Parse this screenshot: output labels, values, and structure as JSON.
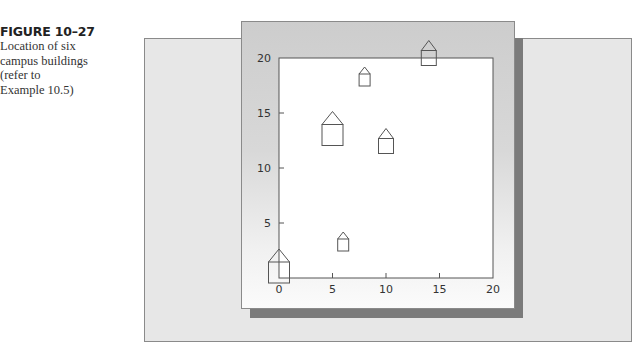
{
  "caption": {
    "figure_label": "FIGURE 10–27",
    "lines": [
      "Location of six",
      "campus buildings",
      "(refer to",
      "Example 10.5)"
    ]
  },
  "colors": {
    "outer_panel": "#e7e7e7",
    "card": "#cdcdcd",
    "shadow": "#7b7b7b",
    "plot_background": "#ffffff",
    "lines": "#555555"
  },
  "chart_data": {
    "type": "scatter",
    "title": "Location of six campus buildings",
    "xlabel": "",
    "ylabel": "",
    "xlim": [
      0,
      20
    ],
    "ylim": [
      0,
      20
    ],
    "x_ticks": [
      0,
      5,
      10,
      15,
      20
    ],
    "y_ticks": [
      5,
      10,
      15,
      20
    ],
    "x_tick_labels": [
      "0",
      "5",
      "10",
      "15",
      "20"
    ],
    "y_tick_labels": [
      "5",
      "10",
      "15",
      "20"
    ],
    "grid": false,
    "legend": null,
    "marker": "house-icon",
    "points": [
      {
        "x": 0,
        "y": 0.5,
        "size": "large"
      },
      {
        "x": 5,
        "y": 13,
        "size": "large"
      },
      {
        "x": 6,
        "y": 3,
        "size": "small"
      },
      {
        "x": 8,
        "y": 18,
        "size": "small"
      },
      {
        "x": 10,
        "y": 12,
        "size": "medium"
      },
      {
        "x": 14,
        "y": 20,
        "size": "medium"
      }
    ]
  }
}
